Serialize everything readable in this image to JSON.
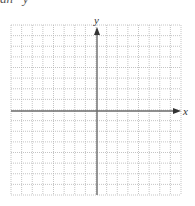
{
  "header": {
    "clipped_text": "an   y   =   "
  },
  "graph": {
    "x_label": "x",
    "y_label": "y",
    "grid_cells_x": 16,
    "grid_cells_y": 16,
    "grid_style": "dotted",
    "colors": {
      "grid": "#b5b5b5",
      "axis": "#6b6b6b",
      "background": "#ffffff"
    }
  }
}
